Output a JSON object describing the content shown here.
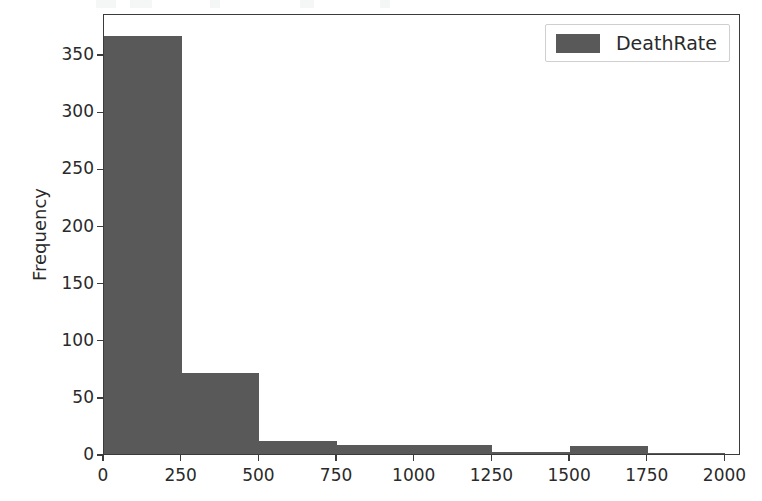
{
  "chart_data": {
    "type": "bar",
    "title": "",
    "subtitle": "",
    "xlabel": "",
    "ylabel": "Frequency",
    "xlim": [
      0,
      2050
    ],
    "ylim": [
      0,
      386
    ],
    "grid": false,
    "legend_position": "upper right",
    "bar_color": "#595959",
    "series": [
      {
        "name": "DeathRate",
        "bin_edges": [
          0,
          250,
          500,
          750,
          1000,
          1250,
          1500,
          1750,
          2000
        ],
        "values": [
          366,
          71,
          11,
          8,
          8,
          2,
          7,
          1
        ]
      }
    ],
    "bins": [
      {
        "range": "0-250",
        "start": 0,
        "end": 250,
        "frequency": 366
      },
      {
        "range": "250-500",
        "start": 250,
        "end": 500,
        "frequency": 71
      },
      {
        "range": "500-750",
        "start": 500,
        "end": 750,
        "frequency": 11
      },
      {
        "range": "750-1000",
        "start": 750,
        "end": 1000,
        "frequency": 8
      },
      {
        "range": "1000-1250",
        "start": 1000,
        "end": 1250,
        "frequency": 8
      },
      {
        "range": "1250-1500",
        "start": 1250,
        "end": 1500,
        "frequency": 2
      },
      {
        "range": "1500-1750",
        "start": 1500,
        "end": 1750,
        "frequency": 7
      },
      {
        "range": "1750-2000",
        "start": 1750,
        "end": 2000,
        "frequency": 1
      }
    ],
    "xticks": [
      0,
      250,
      500,
      750,
      1000,
      1250,
      1500,
      1750,
      2000
    ],
    "xtick_labels": [
      "0",
      "250",
      "500",
      "750",
      "1000",
      "1250",
      "1500",
      "1750",
      "2000"
    ],
    "yticks": [
      0,
      50,
      100,
      150,
      200,
      250,
      300,
      350
    ],
    "ytick_labels": [
      "0",
      "50",
      "100",
      "150",
      "200",
      "250",
      "300",
      "350"
    ],
    "legend": [
      {
        "label": "DeathRate",
        "color": "#595959"
      }
    ]
  }
}
